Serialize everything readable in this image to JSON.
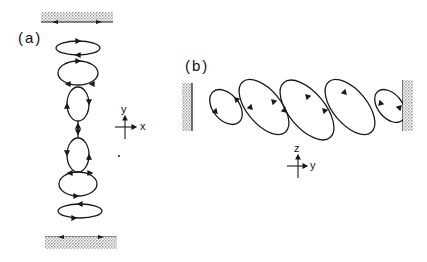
{
  "figure": {
    "panels": [
      {
        "id": "a",
        "label": "(a)",
        "axes": {
          "vertical": "y",
          "horizontal": "x"
        },
        "walls": [
          "top",
          "bottom"
        ],
        "loops": 6
      },
      {
        "id": "b",
        "label": "(b)",
        "axes": {
          "vertical": "z",
          "horizontal": "y"
        },
        "walls": [
          "left",
          "right"
        ],
        "loops": 5
      }
    ]
  },
  "colors": {
    "ink": "#1a1a1a",
    "hatch": "#bdbdbd"
  }
}
